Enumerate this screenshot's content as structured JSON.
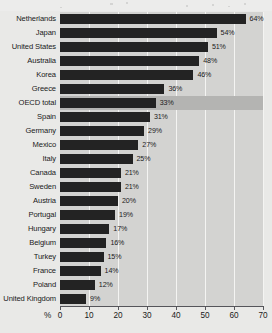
{
  "chart_data": {
    "type": "bar",
    "orientation": "horizontal",
    "title": "",
    "subtitle": "",
    "xlabel": "%",
    "ylabel": "",
    "xlim": [
      0,
      70
    ],
    "xticks": [
      0,
      10,
      20,
      30,
      40,
      50,
      60,
      70
    ],
    "xtick_labels": [
      "0",
      "10",
      "20",
      "30",
      "40",
      "50",
      "60",
      "70"
    ],
    "grid": true,
    "grid_axis": "x",
    "legend": false,
    "highlighted_category": "OECD total",
    "value_suffix": "%",
    "categories": [
      "Netherlands",
      "Japan",
      "United States",
      "Australia",
      "Korea",
      "Greece",
      "OECD total",
      "Spain",
      "Germany",
      "Mexico",
      "Italy",
      "Canada",
      "Sweden",
      "Austria",
      "Portugal",
      "Hungary",
      "Belgium",
      "Turkey",
      "France",
      "Poland",
      "United Kingdom"
    ],
    "values": [
      64,
      54,
      51,
      48,
      46,
      36,
      33,
      31,
      29,
      27,
      25,
      21,
      21,
      20,
      19,
      17,
      16,
      15,
      14,
      12,
      9
    ],
    "data_labels": [
      "64%",
      "54%",
      "51%",
      "48%",
      "46%",
      "36%",
      "33%",
      "31%",
      "29%",
      "27%",
      "25%",
      "21%",
      "21%",
      "20%",
      "19%",
      "17%",
      "16%",
      "15%",
      "14%",
      "12%",
      "9%"
    ]
  },
  "colors": {
    "bar": "#232323",
    "plot_background": "#d3d3d1",
    "highlight_band": "#b4b4b2",
    "gridline": "#f4f4f2",
    "axis": "#55555a",
    "text": "#19191a",
    "page_background": "#e9e9e7"
  }
}
